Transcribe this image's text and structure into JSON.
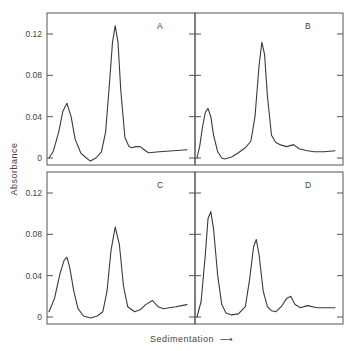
{
  "figure": {
    "ylabel": "Absorbance",
    "xlabel": "Sedimentation",
    "xlabel_arrow": "⟶",
    "ink_color": "#3a3a3a",
    "frame_color": "#555555"
  },
  "chart_data": [
    {
      "type": "line",
      "panel": "A",
      "title": "A",
      "xlabel": "Sedimentation",
      "ylabel": "Absorbance",
      "yticks": [
        0,
        0.04,
        0.08,
        0.12
      ],
      "ytick_labels": [
        "0",
        "0.04",
        "0.08",
        "0.12"
      ],
      "ylim": [
        -0.004,
        0.14
      ],
      "grid": false,
      "x": [
        0.0,
        0.03,
        0.07,
        0.1,
        0.13,
        0.16,
        0.19,
        0.23,
        0.27,
        0.3,
        0.34,
        0.38,
        0.41,
        0.44,
        0.46,
        0.48,
        0.5,
        0.52,
        0.55,
        0.58,
        0.6,
        0.63,
        0.66,
        0.69,
        0.72,
        0.8,
        0.9,
        1.0
      ],
      "values": [
        0.0,
        0.006,
        0.025,
        0.045,
        0.053,
        0.04,
        0.018,
        0.005,
        0.0,
        -0.003,
        0.0,
        0.006,
        0.025,
        0.075,
        0.112,
        0.128,
        0.112,
        0.065,
        0.02,
        0.011,
        0.01,
        0.011,
        0.011,
        0.008,
        0.005,
        0.006,
        0.007,
        0.008
      ]
    },
    {
      "type": "line",
      "panel": "B",
      "title": "B",
      "xlabel": "Sedimentation",
      "ylabel": "Absorbance",
      "yticks": [
        0,
        0.04,
        0.08,
        0.12
      ],
      "ytick_labels": [
        "0",
        "0.04",
        "0.08",
        "0.12"
      ],
      "ylim": [
        -0.004,
        0.14
      ],
      "grid": false,
      "x": [
        0.0,
        0.02,
        0.04,
        0.06,
        0.08,
        0.1,
        0.12,
        0.15,
        0.18,
        0.2,
        0.25,
        0.3,
        0.35,
        0.39,
        0.42,
        0.45,
        0.47,
        0.49,
        0.51,
        0.54,
        0.57,
        0.6,
        0.65,
        0.7,
        0.74,
        0.8,
        0.85,
        0.92,
        1.0
      ],
      "values": [
        0.0,
        0.012,
        0.03,
        0.044,
        0.048,
        0.04,
        0.022,
        0.006,
        0.0,
        -0.001,
        0.001,
        0.005,
        0.01,
        0.016,
        0.04,
        0.09,
        0.112,
        0.1,
        0.06,
        0.022,
        0.015,
        0.013,
        0.011,
        0.013,
        0.009,
        0.007,
        0.006,
        0.006,
        0.007
      ]
    },
    {
      "type": "line",
      "panel": "C",
      "title": "C",
      "xlabel": "Sedimentation",
      "ylabel": "Absorbance",
      "yticks": [
        0,
        0.04,
        0.08,
        0.12
      ],
      "ytick_labels": [
        "0",
        "0.04",
        "0.08",
        "0.12"
      ],
      "ylim": [
        -0.004,
        0.14
      ],
      "grid": false,
      "x": [
        0.0,
        0.04,
        0.08,
        0.11,
        0.13,
        0.15,
        0.18,
        0.21,
        0.25,
        0.3,
        0.35,
        0.39,
        0.42,
        0.45,
        0.48,
        0.51,
        0.54,
        0.57,
        0.62,
        0.66,
        0.7,
        0.75,
        0.79,
        0.83,
        0.87,
        0.92,
        0.96,
        1.0
      ],
      "values": [
        0.005,
        0.018,
        0.042,
        0.055,
        0.058,
        0.048,
        0.025,
        0.008,
        0.001,
        -0.001,
        0.001,
        0.005,
        0.025,
        0.065,
        0.087,
        0.07,
        0.03,
        0.01,
        0.005,
        0.007,
        0.012,
        0.016,
        0.01,
        0.008,
        0.009,
        0.01,
        0.011,
        0.012
      ]
    },
    {
      "type": "line",
      "panel": "D",
      "title": "D",
      "xlabel": "Sedimentation",
      "ylabel": "Absorbance",
      "yticks": [
        0,
        0.04,
        0.08,
        0.12
      ],
      "ytick_labels": [
        "0",
        "0.04",
        "0.08",
        "0.12"
      ],
      "ylim": [
        -0.004,
        0.14
      ],
      "grid": false,
      "x": [
        0.0,
        0.03,
        0.06,
        0.08,
        0.1,
        0.12,
        0.15,
        0.18,
        0.21,
        0.25,
        0.3,
        0.35,
        0.38,
        0.41,
        0.43,
        0.45,
        0.48,
        0.51,
        0.54,
        0.57,
        0.61,
        0.65,
        0.68,
        0.71,
        0.75,
        0.8,
        0.87,
        0.94,
        1.0
      ],
      "values": [
        0.0,
        0.015,
        0.06,
        0.095,
        0.102,
        0.085,
        0.04,
        0.012,
        0.004,
        0.002,
        0.003,
        0.01,
        0.035,
        0.068,
        0.075,
        0.06,
        0.025,
        0.01,
        0.006,
        0.005,
        0.01,
        0.018,
        0.02,
        0.012,
        0.009,
        0.011,
        0.009,
        0.009,
        0.009
      ]
    }
  ]
}
